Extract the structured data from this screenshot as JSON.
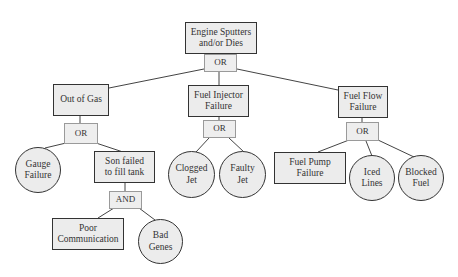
{
  "diagram": {
    "type": "fault-tree",
    "top_event": {
      "label": "Engine Sputters and/or Dies",
      "line1": "Engine Sputters",
      "line2": "and/or Dies",
      "gate": "OR"
    },
    "branches": [
      {
        "label": "Out of Gas",
        "line1": "Out of Gas",
        "gate": "OR",
        "children": [
          {
            "label": "Gauge Failure",
            "line1": "Gauge",
            "line2": "Failure",
            "shape": "circle"
          },
          {
            "label": "Son failed to fill tank",
            "line1": "Son failed",
            "line2": "to fill tank",
            "shape": "rectangle",
            "gate": "AND",
            "children": [
              {
                "label": "Poor Communication",
                "line1": "Poor",
                "line2": "Communication",
                "shape": "rectangle"
              },
              {
                "label": "Bad Genes",
                "line1": "Bad",
                "line2": "Genes",
                "shape": "circle"
              }
            ]
          }
        ]
      },
      {
        "label": "Fuel Injector Failure",
        "line1": "Fuel Injector",
        "line2": "Failure",
        "gate": "OR",
        "children": [
          {
            "label": "Clogged Jet",
            "line1": "Clogged",
            "line2": "Jet",
            "shape": "circle"
          },
          {
            "label": "Faulty Jet",
            "line1": "Faulty",
            "line2": "Jet",
            "shape": "circle"
          }
        ]
      },
      {
        "label": "Fuel Flow Failure",
        "line1": "Fuel Flow",
        "line2": "Failure",
        "gate": "OR",
        "children": [
          {
            "label": "Fuel Pump Failure",
            "line1": "Fuel Pump",
            "line2": "Failure",
            "shape": "rectangle"
          },
          {
            "label": "Iced Lines",
            "line1": "Iced",
            "line2": "Lines",
            "shape": "circle"
          },
          {
            "label": "Blocked Fuel",
            "line1": "Blocked",
            "line2": "Fuel",
            "shape": "circle"
          }
        ]
      }
    ]
  },
  "colors": {
    "node_fill": "#ececec",
    "node_border": "#333333",
    "gate_border": "#9a9a9a",
    "connector": "#444444"
  }
}
